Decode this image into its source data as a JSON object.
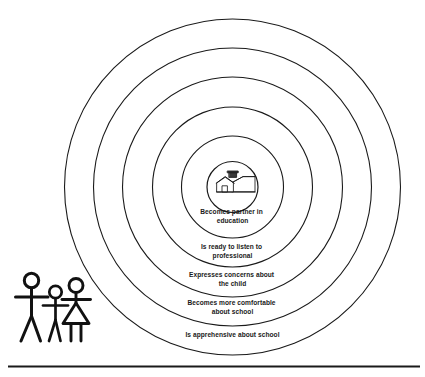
{
  "diagram": {
    "type": "concentric-rings",
    "center_icon": "schoolhouse-icon",
    "family_icon": "family-stick-figures-icon",
    "line_color": "#1a1a1a",
    "background_color": "#ffffff",
    "rings": [
      {
        "index": 1,
        "name": "ring-becomes-partner",
        "label_line1": "Becomes  partner in",
        "label_line2": "education",
        "radius": 50
      },
      {
        "index": 2,
        "name": "ring-ready-to-listen",
        "label_line1": "Is ready to listen to",
        "label_line2": "professional",
        "radius": 76
      },
      {
        "index": 3,
        "name": "ring-expresses-concerns",
        "label_line1": "Expresses concerns about",
        "label_line2": "the child",
        "radius": 104
      },
      {
        "index": 4,
        "name": "ring-more-comfortable",
        "label_line1": "Becomes more comfortable",
        "label_line2": "about school",
        "radius": 133
      },
      {
        "index": 5,
        "name": "ring-apprehensive",
        "label_line1": "Is apprehensive about school",
        "label_line2": "",
        "radius": 160
      }
    ],
    "inner_circle": {
      "name": "ring-school-core",
      "radius": 25,
      "label_line1": "",
      "label_line2": ""
    }
  }
}
